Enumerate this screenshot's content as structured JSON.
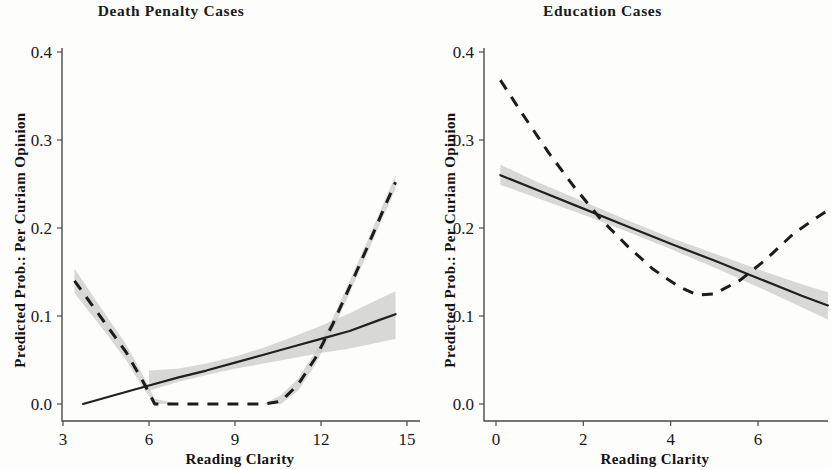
{
  "figure": {
    "background": "#fdfdfc",
    "ink_color": "#1a1a1a",
    "ci_color": "#c9c9c9"
  },
  "panels": [
    {
      "key": "death_penalty",
      "title": "Death Penalty Cases",
      "xlabel": "Reading Clarity",
      "ylabel": "Predicted Prob.: Per Curiam Opinion",
      "x_ticks": [
        "3",
        "6",
        "9",
        "12",
        "15"
      ],
      "y_ticks": [
        "0.0",
        "0.1",
        "0.2",
        "0.3",
        "0.4"
      ]
    },
    {
      "key": "education",
      "title": "Education Cases",
      "xlabel": "Reading Clarity",
      "ylabel": "Predicted Prob.: Per Curiam Opinion",
      "x_ticks": [
        "0",
        "2",
        "4",
        "6"
      ],
      "y_ticks": [
        "0.0",
        "0.1",
        "0.2",
        "0.3",
        "0.4"
      ]
    }
  ],
  "chart_data": [
    {
      "type": "line",
      "panel": "Death Penalty Cases",
      "title": "Death Penalty Cases",
      "xlabel": "Reading Clarity",
      "ylabel": "Predicted Prob.: Per Curiam Opinion",
      "xlim": [
        2.6,
        15.2
      ],
      "ylim": [
        -0.02,
        0.44
      ],
      "x_ticks": [
        3,
        6,
        9,
        12,
        15
      ],
      "y_ticks": [
        0.0,
        0.1,
        0.2,
        0.3,
        0.4
      ],
      "grid": false,
      "legend": "none",
      "series": [
        {
          "name": "linear-fit-solid",
          "style": "solid",
          "x": [
            3.7,
            5.0,
            6.0,
            7.0,
            8.0,
            9.0,
            10.0,
            11.0,
            12.0,
            13.0,
            14.0,
            14.6
          ],
          "y": [
            0.0,
            0.012,
            0.021,
            0.03,
            0.038,
            0.047,
            0.056,
            0.065,
            0.074,
            0.083,
            0.095,
            0.102
          ],
          "ci_lower": [
            0.0,
            0.006,
            0.015,
            0.025,
            0.033,
            0.04,
            0.046,
            0.052,
            0.058,
            0.063,
            0.07,
            0.074
          ],
          "ci_upper": [
            0.0,
            0.018,
            0.038,
            0.04,
            0.046,
            0.054,
            0.064,
            0.076,
            0.089,
            0.103,
            0.119,
            0.128
          ],
          "ci_x_start": 6.0
        },
        {
          "name": "nonlinear-fit-dashed",
          "style": "dashed",
          "x": [
            3.4,
            4.0,
            4.6,
            5.2,
            5.8,
            6.2,
            7.0,
            8.0,
            9.0,
            10.0,
            10.6,
            11.2,
            11.8,
            12.4,
            13.0,
            13.6,
            14.1,
            14.6
          ],
          "y": [
            0.14,
            0.113,
            0.086,
            0.059,
            0.025,
            0.0,
            0.0,
            0.0,
            0.0,
            0.0,
            0.003,
            0.022,
            0.052,
            0.09,
            0.133,
            0.177,
            0.215,
            0.252
          ],
          "ci_lower": [
            0.126,
            0.101,
            0.076,
            0.05,
            0.018,
            0.0,
            0.0,
            0.0,
            0.0,
            0.0,
            0.0,
            0.015,
            0.045,
            0.083,
            0.126,
            0.17,
            0.208,
            0.244
          ],
          "ci_upper": [
            0.154,
            0.125,
            0.096,
            0.068,
            0.032,
            0.006,
            0.0,
            0.0,
            0.0,
            0.0,
            0.01,
            0.029,
            0.059,
            0.097,
            0.14,
            0.184,
            0.222,
            0.26
          ]
        }
      ]
    },
    {
      "type": "line",
      "panel": "Education Cases",
      "title": "Education Cases",
      "xlabel": "Reading Clarity",
      "ylabel": "Predicted Prob.: Per Curiam Opinion",
      "xlim": [
        -0.6,
        7.9
      ],
      "ylim": [
        -0.02,
        0.44
      ],
      "x_ticks": [
        0,
        2,
        4,
        6
      ],
      "y_ticks": [
        0.0,
        0.1,
        0.2,
        0.3,
        0.4
      ],
      "grid": false,
      "legend": "none",
      "series": [
        {
          "name": "linear-fit-solid",
          "style": "solid",
          "x": [
            0.1,
            1.0,
            2.0,
            3.0,
            4.0,
            5.0,
            6.0,
            7.0,
            7.6
          ],
          "y": [
            0.26,
            0.242,
            0.222,
            0.202,
            0.182,
            0.163,
            0.143,
            0.123,
            0.112
          ],
          "ci_lower": [
            0.249,
            0.233,
            0.215,
            0.196,
            0.176,
            0.155,
            0.133,
            0.11,
            0.096
          ],
          "ci_upper": [
            0.272,
            0.251,
            0.23,
            0.209,
            0.189,
            0.171,
            0.153,
            0.136,
            0.127
          ]
        },
        {
          "name": "nonlinear-fit-dashed",
          "style": "dashed",
          "x": [
            0.1,
            0.6,
            1.2,
            1.8,
            2.4,
            3.0,
            3.6,
            4.2,
            4.6,
            5.0,
            5.6,
            6.2,
            6.8,
            7.2,
            7.6
          ],
          "y": [
            0.368,
            0.33,
            0.286,
            0.246,
            0.21,
            0.18,
            0.153,
            0.133,
            0.124,
            0.125,
            0.141,
            0.165,
            0.193,
            0.207,
            0.22
          ],
          "ci_lower": null,
          "ci_upper": null
        }
      ],
      "annotations": [
        {
          "text": "dashed curve minimum",
          "x": 4.6,
          "y": 0.124
        },
        {
          "text": "curves intersect",
          "x": 5.8,
          "y": 0.148
        }
      ]
    }
  ]
}
